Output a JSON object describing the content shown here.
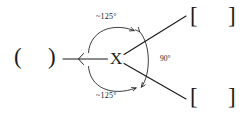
{
  "diagram": {
    "type": "molecular-bond-angle-diagram",
    "background_color": "#ffffff",
    "stroke_color": "#1b1b1b",
    "center_atom": "X",
    "angles": {
      "top": "~125°",
      "bottom": "~125°",
      "right": "90°"
    },
    "substituents": {
      "left_group_open": "(",
      "left_group_close": ")",
      "upper_right_open": "[",
      "upper_right_close": "]",
      "lower_right_open": "[",
      "lower_right_close": "]"
    }
  }
}
